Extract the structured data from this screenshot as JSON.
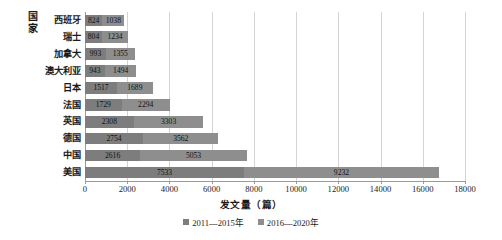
{
  "chart_data": {
    "type": "bar",
    "orientation": "horizontal",
    "stacked": true,
    "title": "",
    "xlabel": "发文量（篇）",
    "ylabel": "国家",
    "ylabel_chars": [
      "国",
      "家"
    ],
    "categories": [
      "西班牙",
      "瑞士",
      "加拿大",
      "澳大利亚",
      "日本",
      "法国",
      "英国",
      "德国",
      "中国",
      "美国"
    ],
    "series": [
      {
        "name": "2011—2015年",
        "color": "#7d7d7d",
        "values": [
          824,
          804,
          993,
          943,
          1517,
          1729,
          2308,
          2754,
          2616,
          7533
        ]
      },
      {
        "name": "2016—2020年",
        "color": "#8e8e8e",
        "values": [
          1038,
          1234,
          1355,
          1494,
          1689,
          2294,
          3303,
          3562,
          5053,
          9232
        ]
      }
    ],
    "xlim": [
      0,
      18000
    ],
    "xticks": [
      0,
      2000,
      4000,
      6000,
      8000,
      10000,
      12000,
      14000,
      16000,
      18000
    ],
    "xtick_labels": [
      "0",
      "2000",
      "4000",
      "6000",
      "8000",
      "10000",
      "12000",
      "14000",
      "16000",
      "18000"
    ],
    "grid": true,
    "grid_axis": "x",
    "legend_position": "bottom",
    "data_labels": true
  },
  "legend": {
    "items": [
      {
        "label": "2011—2015年",
        "color": "#7d7d7d"
      },
      {
        "label": "2016—2020年",
        "color": "#8e8e8e"
      }
    ]
  },
  "axis": {
    "x_title": "发文量（篇）",
    "y_title_line1": "国",
    "y_title_line2": "家"
  }
}
